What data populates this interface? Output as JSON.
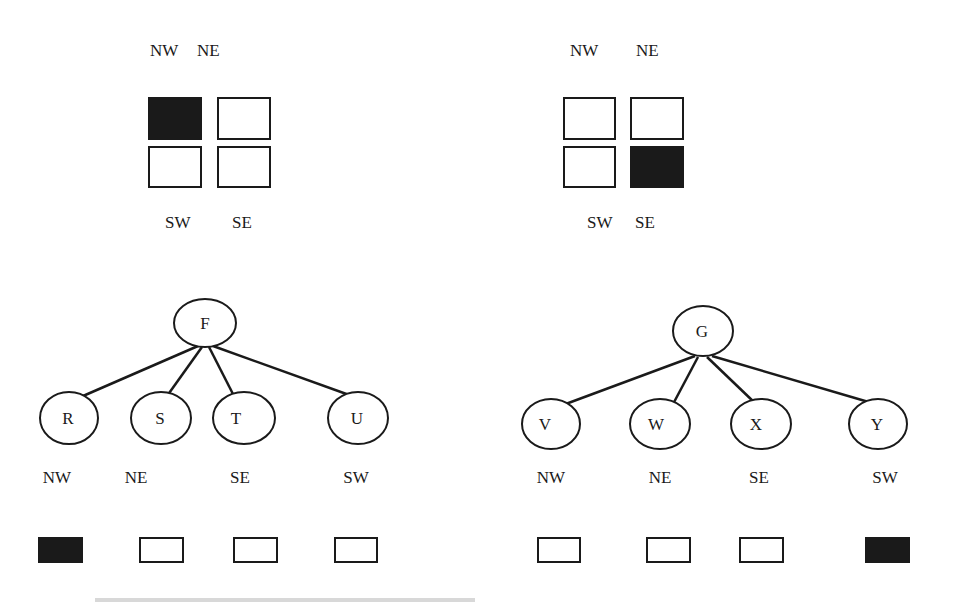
{
  "colors": {
    "ink": "#1a1a1a",
    "fill": "#1a1a1a",
    "paper": "#ffffff"
  },
  "quadrant_grids": [
    {
      "id": "left",
      "top_labels": [
        "NW",
        "NE"
      ],
      "bottom_labels": [
        "SW",
        "SE"
      ],
      "cells": {
        "NW": "filled",
        "NE": "empty",
        "SW": "empty",
        "SE": "empty"
      }
    },
    {
      "id": "right",
      "top_labels": [
        "NW",
        "NE"
      ],
      "bottom_labels": [
        "SW",
        "SE"
      ],
      "cells": {
        "NW": "empty",
        "NE": "empty",
        "SW": "empty",
        "SE": "filled"
      }
    }
  ],
  "trees": [
    {
      "id": "left",
      "root": "F",
      "children": [
        {
          "label": "R",
          "quadrant": "NW",
          "state": "filled"
        },
        {
          "label": "S",
          "quadrant": "NE",
          "state": "empty"
        },
        {
          "label": "T",
          "quadrant": "SE",
          "state": "empty"
        },
        {
          "label": "U",
          "quadrant": "SW",
          "state": "empty"
        }
      ]
    },
    {
      "id": "right",
      "root": "G",
      "children": [
        {
          "label": "V",
          "quadrant": "NW",
          "state": "empty"
        },
        {
          "label": "W",
          "quadrant": "NE",
          "state": "empty"
        },
        {
          "label": "X",
          "quadrant": "SE",
          "state": "empty"
        },
        {
          "label": "Y",
          "quadrant": "SW",
          "state": "filled"
        }
      ]
    }
  ]
}
